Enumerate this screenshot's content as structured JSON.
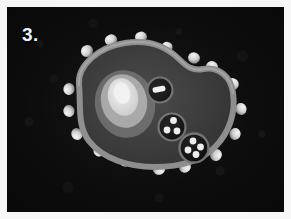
{
  "figure": {
    "panel_label": "3.",
    "label_color": "#f2f2f2",
    "background_color": "#0d0d0d",
    "frame_color": "#f7f7f7",
    "modality": "grayscale electron-micrograph style cell illustration"
  },
  "cell": {
    "name": "cell",
    "membrane_color": "#8a8a8a",
    "membrane_highlight_color": "#9a9a9a",
    "cytoplasm_color": "#3a3a3a",
    "outline_note": "irregular amoeboid outline with upper-right lobe"
  },
  "nucleus": {
    "name": "nucleus",
    "layers": [
      {
        "label": "nuclear-envelope",
        "color": "#6e6e6e"
      },
      {
        "label": "nucleoplasm",
        "color": "#a8a8a8"
      },
      {
        "label": "nucleolus",
        "color": "#dcdcdc"
      },
      {
        "label": "nucleolus-core",
        "color": "#efefef"
      }
    ]
  },
  "organelles": [
    {
      "name": "organelle-upper",
      "shape": "round",
      "body_color": "#121212",
      "rim_color": "#6f6f6f",
      "inclusion_color": "#f0f0f0",
      "inclusion_count": 1,
      "inclusion_shape": "elongated bar"
    },
    {
      "name": "organelle-middle",
      "shape": "round",
      "body_color": "#111111",
      "rim_color": "#6f6f6f",
      "inclusion_color": "#ededed",
      "inclusion_count": 3,
      "inclusion_shape": "round granules"
    },
    {
      "name": "organelle-lower",
      "shape": "round",
      "body_color": "#101010",
      "rim_color": "#727272",
      "inclusion_color": "#ececec",
      "inclusion_count": 4,
      "inclusion_shape": "round granules"
    }
  ],
  "surface_projections": {
    "name": "surface-spikes",
    "count": 18,
    "highlight_color": "#e8e8e8",
    "shadow_color": "#6a6a6a",
    "description": "bright knob-like projections distributed around the cell membrane"
  }
}
